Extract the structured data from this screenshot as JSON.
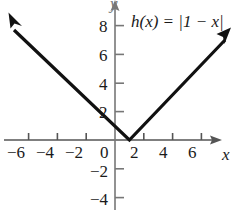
{
  "figure": {
    "background_color": "#ffffff",
    "ink_color": "#1a1a1a",
    "axis_color": "#555555"
  },
  "chart_data": {
    "type": "line",
    "title": "",
    "subtitle": "",
    "function_label": "h(x) = |1 − x|",
    "function_parts": {
      "name": "h",
      "argument": "(x)",
      "equals": "=",
      "expression": "|1 − x|"
    },
    "xlabel": "x",
    "ylabel": "y",
    "xlim": [
      -7.5,
      8.0
    ],
    "ylim": [
      -5.0,
      9.0
    ],
    "grid": false,
    "legend": "none",
    "x_ticks": [
      -6,
      -4,
      -2,
      0,
      2,
      4,
      6
    ],
    "x_tick_labels": [
      "−6",
      "−4",
      "−2",
      "0",
      "2",
      "4",
      "6"
    ],
    "y_ticks": [
      8,
      6,
      4,
      2,
      -2,
      -4
    ],
    "y_tick_labels": [
      "8",
      "6",
      "4",
      "2",
      "−2",
      "−4"
    ],
    "vertex": [
      1,
      0
    ],
    "series": [
      {
        "name": "h(x) = |1 - x|",
        "x": [
          -6.6,
          1,
          8.0
        ],
        "values": [
          7.6,
          0,
          7.0
        ],
        "color": "#111111",
        "arrow_start": true,
        "arrow_end": true
      }
    ],
    "annotations": [
      {
        "text": "h(x) = |1 − x|",
        "x": 2.2,
        "y": 8.1
      }
    ]
  },
  "axes": {
    "x_axis_name": "x",
    "y_axis_name": "y",
    "x_arrow": true,
    "y_arrow": true
  },
  "tick_labels": {
    "x": [
      {
        "text": "−6",
        "left": 7,
        "top": 144
      },
      {
        "text": "−4",
        "left": 36,
        "top": 144
      },
      {
        "text": "−2",
        "left": 65,
        "top": 144
      },
      {
        "text": "0",
        "left": 100,
        "top": 144
      },
      {
        "text": "2",
        "left": 130,
        "top": 144
      },
      {
        "text": "4",
        "left": 159,
        "top": 144
      },
      {
        "text": "6",
        "left": 188,
        "top": 144
      }
    ],
    "y": [
      {
        "text": "8",
        "left": 99,
        "top": 18
      },
      {
        "text": "6",
        "left": 99,
        "top": 47
      },
      {
        "text": "4",
        "left": 99,
        "top": 76
      },
      {
        "text": "2",
        "left": 99,
        "top": 104
      },
      {
        "text": "−2",
        "left": 90,
        "top": 163
      },
      {
        "text": "−4",
        "left": 90,
        "top": 191
      }
    ]
  }
}
